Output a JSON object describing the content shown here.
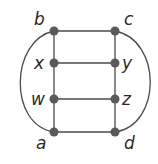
{
  "diagram": {
    "type": "graph",
    "nodes": [
      {
        "id": "b",
        "label": "b",
        "x": 54,
        "y": 31,
        "lx": 34,
        "ly": 25
      },
      {
        "id": "c",
        "label": "c",
        "x": 115,
        "y": 31,
        "lx": 124,
        "ly": 25
      },
      {
        "id": "x",
        "label": "x",
        "x": 54,
        "y": 63,
        "lx": 34,
        "ly": 69
      },
      {
        "id": "y",
        "label": "y",
        "x": 115,
        "y": 63,
        "lx": 122,
        "ly": 69
      },
      {
        "id": "w",
        "label": "w",
        "x": 54,
        "y": 99,
        "lx": 31,
        "ly": 105
      },
      {
        "id": "z",
        "label": "z",
        "x": 115,
        "y": 99,
        "lx": 122,
        "ly": 105
      },
      {
        "id": "a",
        "label": "a",
        "x": 54,
        "y": 132,
        "lx": 36,
        "ly": 149
      },
      {
        "id": "d",
        "label": "d",
        "x": 115,
        "y": 132,
        "lx": 124,
        "ly": 149
      }
    ],
    "edges": [
      [
        "b",
        "c"
      ],
      [
        "x",
        "y"
      ],
      [
        "w",
        "z"
      ],
      [
        "a",
        "d"
      ],
      [
        "b",
        "x"
      ],
      [
        "x",
        "w"
      ],
      [
        "w",
        "a"
      ],
      [
        "c",
        "y"
      ],
      [
        "y",
        "z"
      ],
      [
        "z",
        "d"
      ]
    ],
    "curved_edges": [
      {
        "from": "b",
        "to": "a",
        "side": "left",
        "path": "M54,31 C10,40 8,125 54,132"
      },
      {
        "from": "c",
        "to": "d",
        "side": "right",
        "path": "M115,31 C162,40 162,125 115,132"
      }
    ],
    "colors": {
      "edge": "#4a4a4a",
      "node": "#5a5a5a",
      "label": "#2a2a2a"
    }
  }
}
